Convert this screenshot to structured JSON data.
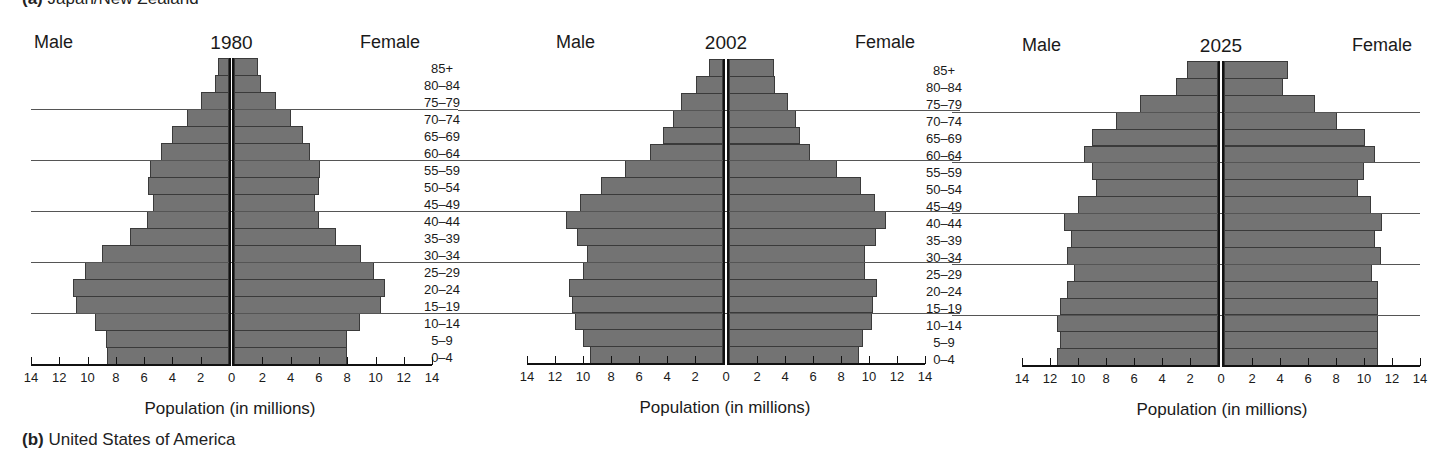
{
  "captions": {
    "top": {
      "prefix": "(a)",
      "text": "Japan/New Zealand"
    },
    "bottom": {
      "prefix": "(b)",
      "text": "United States of America"
    }
  },
  "chart_data": [
    {
      "type": "bar",
      "subtype": "population-pyramid",
      "title": "1980",
      "left_label": "Male",
      "right_label": "Female",
      "xlabel": "Population (in millions)",
      "xticks": [
        "14",
        "12",
        "10",
        "8",
        "6",
        "4",
        "2",
        "0",
        "2",
        "4",
        "6",
        "8",
        "10",
        "12",
        "14"
      ],
      "xlim": [
        -14,
        14
      ],
      "categories": [
        "85+",
        "80–84",
        "75–79",
        "70–74",
        "65–69",
        "60–64",
        "55–59",
        "50–54",
        "45–49",
        "40–44",
        "35–39",
        "30–34",
        "25–29",
        "20–24",
        "15–19",
        "10–14",
        "5–9",
        "0–4"
      ],
      "series": [
        {
          "name": "Male",
          "values": [
            0.8,
            1.0,
            2.0,
            3.0,
            4.0,
            4.8,
            5.6,
            5.7,
            5.4,
            5.8,
            7.0,
            9.0,
            10.2,
            11.0,
            10.8,
            9.5,
            8.7,
            8.6
          ]
        },
        {
          "name": "Female",
          "values": [
            1.7,
            1.9,
            3.0,
            4.0,
            4.9,
            5.4,
            6.1,
            6.0,
            5.7,
            6.0,
            7.2,
            9.0,
            9.9,
            10.7,
            10.4,
            8.9,
            8.0,
            8.0
          ]
        }
      ],
      "grid": "horizontal lines every 3 age groups"
    },
    {
      "type": "bar",
      "subtype": "population-pyramid",
      "title": "2002",
      "left_label": "Male",
      "right_label": "Female",
      "xlabel": "Population (in millions)",
      "xticks": [
        "14",
        "12",
        "10",
        "8",
        "6",
        "4",
        "2",
        "0",
        "2",
        "4",
        "6",
        "8",
        "10",
        "12",
        "14"
      ],
      "xlim": [
        -14,
        14
      ],
      "categories": [
        "85+",
        "80–84",
        "75–79",
        "70–74",
        "65–69",
        "60–64",
        "55–59",
        "50–54",
        "45–49",
        "40–44",
        "35–39",
        "30–34",
        "25–29",
        "20–24",
        "15–19",
        "10–14",
        "5–9",
        "0–4"
      ],
      "series": [
        {
          "name": "Male",
          "values": [
            1.0,
            1.9,
            3.0,
            3.6,
            4.3,
            5.2,
            7.0,
            8.7,
            10.2,
            11.2,
            10.4,
            9.7,
            10.0,
            11.0,
            10.8,
            10.6,
            10.0,
            9.5
          ]
        },
        {
          "name": "Female",
          "values": [
            3.2,
            3.3,
            4.2,
            4.8,
            5.1,
            5.8,
            7.7,
            9.4,
            10.4,
            11.2,
            10.5,
            9.7,
            9.7,
            10.6,
            10.3,
            10.2,
            9.6,
            9.3
          ]
        }
      ],
      "grid": "horizontal lines every 3 age groups"
    },
    {
      "type": "bar",
      "subtype": "population-pyramid",
      "title": "2025",
      "left_label": "Male",
      "right_label": "Female",
      "xlabel": "Population (in millions)",
      "xticks": [
        "14",
        "12",
        "10",
        "8",
        "6",
        "4",
        "2",
        "0",
        "2",
        "4",
        "6",
        "8",
        "10",
        "12",
        "14"
      ],
      "xlim": [
        -14,
        14
      ],
      "categories": [
        "85+",
        "80–84",
        "75–79",
        "70–74",
        "65–69",
        "60–64",
        "55–59",
        "50–54",
        "45–49",
        "40–44",
        "35–39",
        "30–34",
        "25–29",
        "20–24",
        "15–19",
        "10–14",
        "5–9",
        "0–4"
      ],
      "series": [
        {
          "name": "Male",
          "values": [
            2.2,
            3.0,
            5.6,
            7.3,
            9.0,
            9.6,
            9.0,
            8.7,
            10.0,
            11.0,
            10.5,
            10.8,
            10.3,
            10.8,
            11.3,
            11.5,
            11.3,
            11.5
          ]
        },
        {
          "name": "Female",
          "values": [
            4.6,
            4.2,
            6.5,
            8.1,
            10.1,
            10.8,
            10.0,
            9.6,
            10.5,
            11.3,
            10.8,
            11.2,
            10.6,
            11.0,
            11.0,
            11.0,
            11.0,
            11.0
          ]
        }
      ],
      "grid": "horizontal lines every 3 age groups"
    }
  ],
  "colors": {
    "bar": "#737373",
    "bar_border": "#3a3a3a",
    "axis": "#111111",
    "grid": "#555555"
  }
}
